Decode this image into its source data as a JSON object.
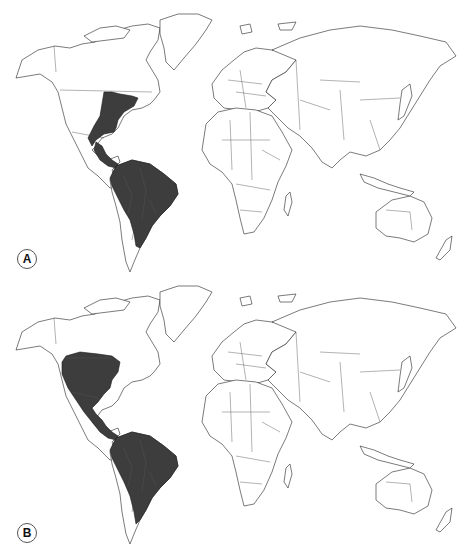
{
  "figure": {
    "panels": [
      {
        "label": "A",
        "description": "World map with shaded range covering eastern United States, Central America and northern/central South America",
        "shaded_regions": [
          "Eastern United States",
          "Southern Mexico / Central America",
          "Colombia",
          "Venezuela",
          "Ecuador",
          "Peru",
          "Bolivia",
          "Brazil",
          "Paraguay",
          "Northern Argentina",
          "Uruguay"
        ]
      },
      {
        "label": "B",
        "description": "World map with shaded range covering western and central United States, Mexico, Central America and northern/central South America",
        "shaded_regions": [
          "Western and Central United States",
          "Mexico",
          "Central America",
          "Colombia",
          "Venezuela",
          "Ecuador",
          "Peru",
          "Bolivia",
          "Brazil",
          "Paraguay",
          "Northern Argentina",
          "Uruguay"
        ]
      }
    ]
  },
  "colors": {
    "background": "#ffffff",
    "land": "#ffffff",
    "outline": "#222222",
    "shaded": "#3d3d3d"
  }
}
